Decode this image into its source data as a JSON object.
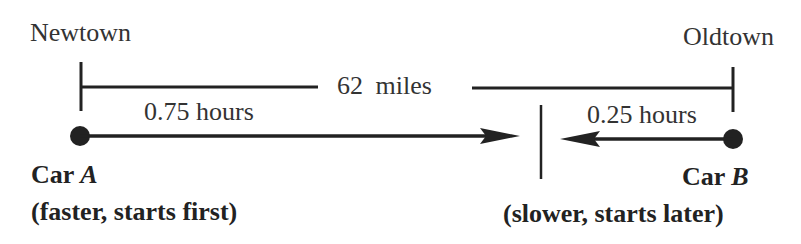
{
  "diagram": {
    "towns": {
      "left": "Newtown",
      "right": "Oldtown"
    },
    "distance_label": "62 miles",
    "car_a": {
      "name_prefix": "Car",
      "name_letter": "A",
      "time_label": "0.75 hours",
      "description": "(faster, starts first)",
      "direction": "right"
    },
    "car_b": {
      "name_prefix": "Car",
      "name_letter": "B",
      "time_label": "0.25 hours",
      "description": "(slower, starts later)",
      "direction": "left"
    },
    "colors": {
      "line": "#222222",
      "text": "#2a2a2a",
      "background": "#ffffff"
    }
  }
}
